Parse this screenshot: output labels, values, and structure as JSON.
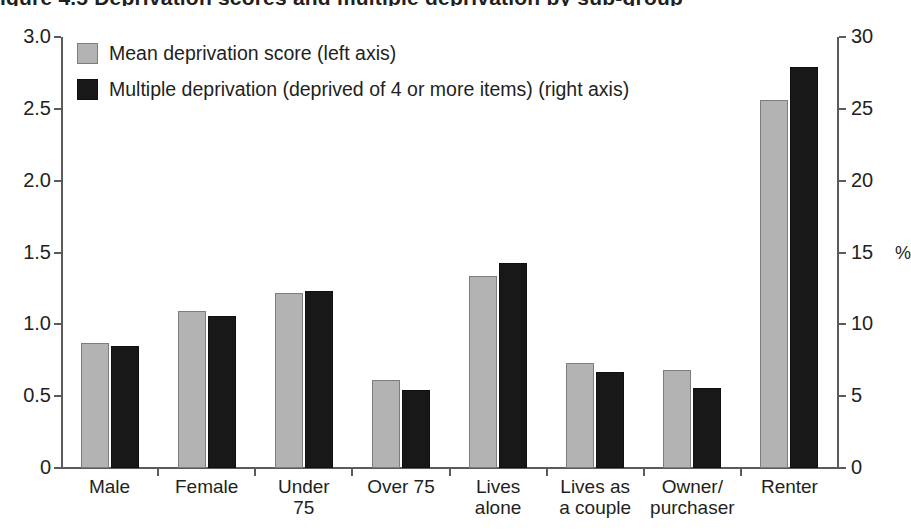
{
  "title_remnant": "igure 4.5  Deprivation scores and multiple deprivation by sub-group",
  "legend": {
    "position": "top-left inside plot",
    "items": [
      {
        "label": "Mean deprivation score (left axis)",
        "swatch": "grey-square-icon",
        "color": "#b3b3b3"
      },
      {
        "label": "Multiple deprivation (deprived of 4 or more items) (right axis)",
        "swatch": "black-square-icon",
        "color": "#181818"
      }
    ]
  },
  "axes": {
    "left_ticks": [
      "0",
      "0.5",
      "1.0",
      "1.5",
      "2.0",
      "2.5",
      "3.0"
    ],
    "right_ticks": [
      "0",
      "5",
      "10",
      "15",
      "20",
      "25",
      "30"
    ],
    "right_unit_label": "%"
  },
  "chart_data": {
    "type": "bar",
    "title": "Deprivation scores and multiple deprivation by sub-group",
    "xlabel": "",
    "ylabel": "",
    "ylim": [
      0,
      3
    ],
    "y2lim": [
      0,
      30
    ],
    "grid": false,
    "legend_position": "top-left",
    "categories": [
      "Male",
      "Female",
      "Under 75",
      "Over 75",
      "Lives alone",
      "Lives as a couple",
      "Owner/ purchaser",
      "Renter"
    ],
    "category_lines": [
      [
        "Male"
      ],
      [
        "Female"
      ],
      [
        "Under",
        "75"
      ],
      [
        "Over 75"
      ],
      [
        "Lives",
        "alone"
      ],
      [
        "Lives as",
        "a couple"
      ],
      [
        "Owner/",
        "purchaser"
      ],
      [
        "Renter"
      ]
    ],
    "series": [
      {
        "name": "Mean deprivation score (left axis)",
        "axis": "left",
        "color": "#b3b3b3",
        "values": [
          0.87,
          1.09,
          1.22,
          0.61,
          1.34,
          0.73,
          0.68,
          2.56
        ]
      },
      {
        "name": "Multiple deprivation (deprived of 4 or more items) (right axis)",
        "axis": "right",
        "color": "#181818",
        "values": [
          8.5,
          10.6,
          12.3,
          5.4,
          14.3,
          6.7,
          5.6,
          27.9
        ]
      }
    ]
  }
}
